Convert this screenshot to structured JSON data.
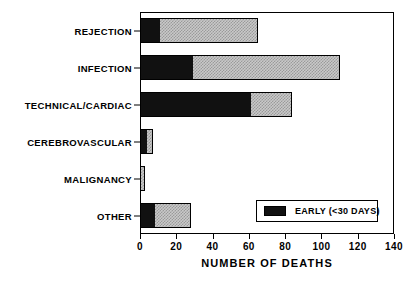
{
  "chart_data": {
    "type": "bar",
    "orientation": "horizontal",
    "stacked": true,
    "title": "",
    "xlabel": "NUMBER OF DEATHS",
    "ylabel": "",
    "xlim": [
      0,
      140
    ],
    "xticks": [
      0,
      20,
      40,
      60,
      80,
      100,
      120,
      140
    ],
    "xticklabels": [
      "0",
      "20",
      "40",
      "60",
      "80",
      "100",
      "120",
      "140"
    ],
    "grid": false,
    "legend_position": "lower right",
    "categories": [
      "REJECTION",
      "INFECTION",
      "TECHNICAL/CARDIAC",
      "CEREBROVASCULAR",
      "MALIGNANCY",
      "OTHER"
    ],
    "series": [
      {
        "name": "EARLY (<30 DAYS)",
        "color": "#111111",
        "values": [
          11,
          29,
          61,
          4,
          0,
          8
        ]
      },
      {
        "name": "LATE",
        "color": "#c9c9c9",
        "values": [
          54,
          81,
          23,
          3,
          3,
          20
        ]
      }
    ],
    "totals": [
      65,
      110,
      84,
      7,
      3,
      28
    ]
  },
  "legend": {
    "entries": [
      {
        "label": "EARLY (<30 DAYS)",
        "swatch": "#111111"
      }
    ]
  }
}
